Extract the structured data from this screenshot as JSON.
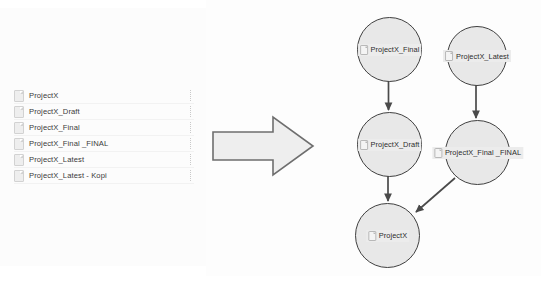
{
  "file_list": {
    "items": [
      {
        "name": "ProjectX",
        "icon": "document-icon"
      },
      {
        "name": "ProjectX_Draft",
        "icon": "document-icon"
      },
      {
        "name": "ProjectX_Final",
        "icon": "document-icon"
      },
      {
        "name": "ProjectX_Final _FINAL",
        "icon": "document-icon"
      },
      {
        "name": "ProjectX_Latest",
        "icon": "document-icon"
      },
      {
        "name": "ProjectX_Latest - Kopi",
        "icon": "document-icon"
      }
    ]
  },
  "transform_arrow": {
    "icon": "right-block-arrow-icon",
    "fill": "#eeeeee",
    "stroke": "#6e6e6e"
  },
  "graph": {
    "node_fill": "#e8e8e8",
    "node_stroke": "#404040",
    "edge_color": "#4a4a4a",
    "nodes": [
      {
        "id": "final",
        "label": "ProjectX_Final",
        "icon": "document-icon"
      },
      {
        "id": "latest",
        "label": "ProjectX_Latest",
        "icon": "document-icon"
      },
      {
        "id": "draft",
        "label": "ProjectX_Draft",
        "icon": "document-icon"
      },
      {
        "id": "final_final",
        "label": "ProjectX_Final _FINAL",
        "icon": "document-icon"
      },
      {
        "id": "projectx",
        "label": "ProjectX",
        "icon": "document-icon"
      }
    ],
    "edges": [
      {
        "from": "final",
        "to": "draft"
      },
      {
        "from": "latest",
        "to": "final_final"
      },
      {
        "from": "draft",
        "to": "projectx"
      },
      {
        "from": "final_final",
        "to": "projectx"
      }
    ]
  }
}
